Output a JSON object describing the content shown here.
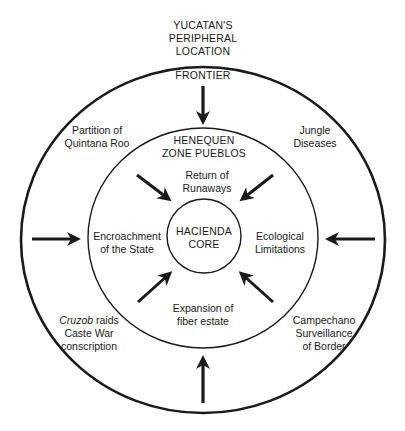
{
  "title": {
    "line1": "YUCATAN'S",
    "line2": "PERIPHERAL",
    "line3": "LOCATION"
  },
  "rings": {
    "outer": {
      "label": "FRONTIER"
    },
    "middle": {
      "label_line1": "HENEQUEN",
      "label_line2": "ZONE PUEBLOS"
    },
    "inner": {
      "label_line1": "HACIENDA",
      "label_line2": "CORE"
    }
  },
  "outer_factors": {
    "top_left": {
      "line1": "Partition of",
      "line2": "Quintana Roo"
    },
    "top_right": {
      "line1": "Jungle",
      "line2": "Diseases"
    },
    "bottom_left": {
      "line1_italic": "Cruzob",
      "line1_rest": " raids",
      "line2": "Caste War",
      "line3": "conscription"
    },
    "bottom_right": {
      "line1": "Campechano",
      "line2": "Surveillance",
      "line3": "of Border"
    }
  },
  "inner_factors": {
    "top": {
      "line1": "Return of",
      "line2": "Runaways"
    },
    "left": {
      "line1": "Encroachment",
      "line2": "of the State"
    },
    "right": {
      "line1": "Ecological",
      "line2": "Limitations"
    },
    "bottom": {
      "line1": "Expansion of",
      "line2": "fiber estate"
    }
  },
  "arrows": {
    "outer": [
      "top",
      "left",
      "right",
      "bottom"
    ],
    "middle": [
      "top-left",
      "top-right",
      "bottom-left",
      "bottom-right"
    ]
  },
  "colors": {
    "ink": "#1a1a1a",
    "background": "#ffffff"
  }
}
